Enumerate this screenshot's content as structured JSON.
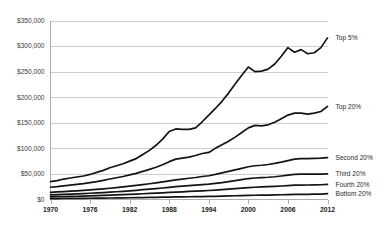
{
  "chart_data": {
    "type": "line",
    "title": "",
    "subtitle": "",
    "xlabel": "",
    "ylabel": "",
    "xlim": [
      1970,
      2012
    ],
    "ylim": [
      0,
      350000
    ],
    "grid": true,
    "legend_position": "right-inline-labels",
    "y_ticks": [
      "$0",
      "$50,000",
      "$100,000",
      "$150,000",
      "$200,000",
      "$250,000",
      "$300,000",
      "$350,000"
    ],
    "y_tick_values": [
      0,
      50000,
      100000,
      150000,
      200000,
      250000,
      300000,
      350000
    ],
    "x_ticks": [
      "1970",
      "1976",
      "1982",
      "1988",
      "1994",
      "2000",
      "2006",
      "2012"
    ],
    "x_tick_values": [
      1970,
      1976,
      1982,
      1988,
      1994,
      2000,
      2006,
      2012
    ],
    "x": [
      1970,
      1971,
      1972,
      1973,
      1974,
      1975,
      1976,
      1977,
      1978,
      1979,
      1980,
      1981,
      1982,
      1983,
      1984,
      1985,
      1986,
      1987,
      1988,
      1989,
      1990,
      1991,
      1992,
      1993,
      1994,
      1995,
      1996,
      1997,
      1998,
      1999,
      2000,
      2001,
      2002,
      2003,
      2004,
      2005,
      2006,
      2007,
      2008,
      2009,
      2010,
      2011,
      2012
    ],
    "series": [
      {
        "name": "Top 5%",
        "label": "Top 5%",
        "color": "#141414",
        "values": [
          35000,
          37000,
          40000,
          42000,
          44000,
          46000,
          49000,
          53000,
          57000,
          62000,
          66000,
          70000,
          75000,
          80000,
          88000,
          96000,
          106000,
          118000,
          133000,
          138000,
          137000,
          137000,
          140000,
          152000,
          165000,
          178000,
          192000,
          208000,
          226000,
          243000,
          259000,
          250000,
          251000,
          255000,
          265000,
          280000,
          297000,
          288000,
          293000,
          285000,
          287000,
          297000,
          316000
        ]
      },
      {
        "name": "Top 20%",
        "label": "Top 20%",
        "color": "#141414",
        "values": [
          24000,
          25000,
          26500,
          28000,
          29500,
          31000,
          33000,
          35000,
          37500,
          40000,
          42500,
          45000,
          48000,
          51000,
          55000,
          59000,
          63000,
          68000,
          74000,
          79000,
          81000,
          83000,
          86000,
          90000,
          92000,
          100000,
          107000,
          114000,
          122000,
          131000,
          140000,
          145000,
          144000,
          146000,
          151000,
          158000,
          165000,
          169000,
          169000,
          167000,
          169000,
          172000,
          182000
        ]
      },
      {
        "name": "Second 20%",
        "label": "Second 20%",
        "color": "#141414",
        "values": [
          14000,
          14800,
          15500,
          16200,
          17000,
          17800,
          18800,
          19800,
          20800,
          22000,
          23200,
          24500,
          26000,
          27500,
          29200,
          30800,
          32500,
          34500,
          36500,
          38500,
          40000,
          41500,
          43000,
          45000,
          46500,
          49000,
          52000,
          55000,
          58000,
          61000,
          64000,
          66000,
          67000,
          68500,
          70500,
          73000,
          76000,
          79000,
          80000,
          80000,
          80500,
          81000,
          82000
        ]
      },
      {
        "name": "Third 20%",
        "label": "Third 20%",
        "color": "#141414",
        "values": [
          9000,
          9500,
          10000,
          10500,
          11000,
          11500,
          12200,
          12900,
          13600,
          14400,
          15200,
          16000,
          17000,
          18000,
          19200,
          20200,
          21300,
          22500,
          23800,
          25000,
          26000,
          27000,
          28000,
          29000,
          30000,
          31500,
          33000,
          35000,
          37000,
          39000,
          41000,
          42000,
          42800,
          43500,
          44500,
          46000,
          47500,
          49000,
          49500,
          49500,
          49600,
          49800,
          50000
        ]
      },
      {
        "name": "Fourth 20%",
        "label": "Fourth 20%",
        "color": "#141414",
        "values": [
          5200,
          5500,
          5800,
          6100,
          6400,
          6700,
          7100,
          7500,
          7900,
          8400,
          8900,
          9400,
          10000,
          10500,
          11200,
          11800,
          12400,
          13100,
          13800,
          14500,
          15100,
          15700,
          16300,
          17000,
          17600,
          18400,
          19200,
          20200,
          21200,
          22300,
          23400,
          24000,
          24500,
          25000,
          25600,
          26400,
          27200,
          28000,
          28300,
          28400,
          28600,
          28800,
          29500
        ]
      },
      {
        "name": "Bottom 20%",
        "label": "Bottom 20%",
        "color": "#141414",
        "values": [
          1800,
          1900,
          2000,
          2100,
          2200,
          2300,
          2450,
          2600,
          2750,
          2900,
          3050,
          3200,
          3400,
          3600,
          3800,
          4000,
          4200,
          4450,
          4700,
          4950,
          5150,
          5350,
          5550,
          5800,
          6000,
          6300,
          6600,
          6950,
          7300,
          7700,
          8100,
          8350,
          8550,
          8750,
          9000,
          9300,
          9600,
          9900,
          10100,
          10200,
          10400,
          10600,
          11500
        ]
      }
    ]
  },
  "axis_colors": {
    "gridline": "#b9b9b9",
    "axis": "#9a9a9a",
    "line": "#141414",
    "tick_text": "#2a2a2a"
  }
}
